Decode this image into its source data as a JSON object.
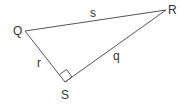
{
  "diagram": {
    "type": "right-triangle",
    "stroke_color": "#555555",
    "vertices": [
      {
        "name": "Q",
        "x": 25,
        "y": 31,
        "label_x": 13,
        "label_y": 35
      },
      {
        "name": "R",
        "x": 166,
        "y": 10,
        "label_x": 168,
        "label_y": 14
      },
      {
        "name": "S",
        "x": 65,
        "y": 82,
        "label_x": 61,
        "label_y": 99
      }
    ],
    "sides": [
      {
        "name": "s",
        "between": "Q-R",
        "label_x": 90,
        "label_y": 17
      },
      {
        "name": "r",
        "between": "Q-S",
        "label_x": 37,
        "label_y": 67
      },
      {
        "name": "q",
        "between": "S-R",
        "label_x": 113,
        "label_y": 60
      }
    ],
    "right_angle_at": "S"
  }
}
